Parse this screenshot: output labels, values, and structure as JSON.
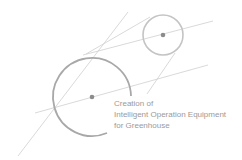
{
  "logo": {
    "caption_lines": [
      "Creation of",
      "Intelligent Operation Equipment",
      "for Greenhouse"
    ],
    "colors": {
      "background": "#ffffff",
      "line": "#c8c8c8",
      "circle_small": "#c4c4c4",
      "circle_large": "#a8a8a8",
      "dot": "#8c8c8c",
      "text": "#9a9a9a"
    }
  }
}
